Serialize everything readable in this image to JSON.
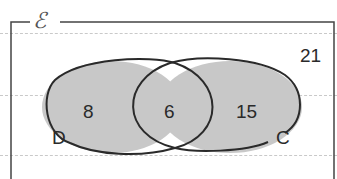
{
  "diagram": {
    "type": "venn",
    "universal_set": {
      "symbol": "ℰ",
      "outside_count": "21"
    },
    "sets": [
      {
        "name": "D",
        "only_count": "8"
      },
      {
        "name": "C",
        "only_count": "15"
      }
    ],
    "intersection": {
      "sets": [
        "D",
        "C"
      ],
      "count": "6"
    },
    "colors": {
      "fill": "#c8c8c8",
      "outline": "#2a2a2a",
      "frame": "#444444",
      "guide_lines": "#c9c9c9"
    }
  }
}
